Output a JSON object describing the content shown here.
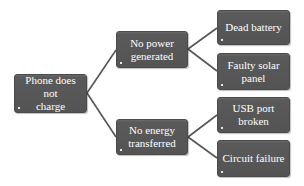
{
  "diagram": {
    "type": "tree",
    "direction": "left-to-right",
    "colors": {
      "node_fill": "#555555",
      "node_text": "#ffffff",
      "connector": "#555555",
      "background": "#ffffff"
    },
    "root": {
      "label": "Phone does not\ncharge"
    },
    "branches": [
      {
        "label": "No power\ngenerated",
        "children": [
          {
            "label": "Dead battery"
          },
          {
            "label": "Faulty solar\npanel"
          }
        ]
      },
      {
        "label": "No energy\ntransferred",
        "children": [
          {
            "label": "USB port broken"
          },
          {
            "label": "Circuit failure"
          }
        ]
      }
    ]
  }
}
